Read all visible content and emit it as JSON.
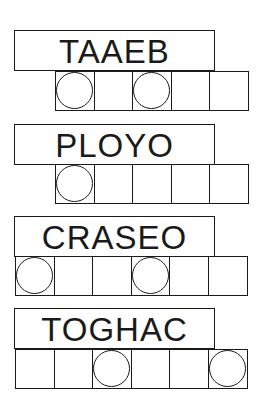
{
  "puzzle": {
    "words": [
      {
        "scrambled": "TAAEB",
        "cells": 5,
        "circled": [
          0,
          2
        ]
      },
      {
        "scrambled": "PLOYO",
        "cells": 5,
        "circled": [
          0
        ]
      },
      {
        "scrambled": "CRASEO",
        "cells": 6,
        "circled": [
          0,
          3
        ]
      },
      {
        "scrambled": "TOGHAC",
        "cells": 6,
        "circled": [
          2,
          5
        ]
      }
    ]
  }
}
